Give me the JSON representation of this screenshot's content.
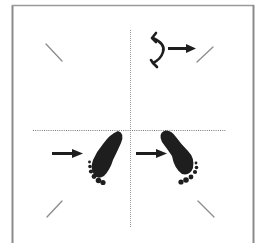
{
  "diagram": {
    "title": "",
    "colors": {
      "frame": "#8a8a8a",
      "divider": "#9a9a9a",
      "tick": "#8c8c8c",
      "ink": "#1e1e1e",
      "background": "#ffffff"
    },
    "quadrants": [
      {
        "id": "top-left",
        "content": [
          "diagonal-tick"
        ]
      },
      {
        "id": "top-right",
        "content": [
          "rotate-icon",
          "right-arrow",
          "diagonal-tick"
        ]
      },
      {
        "id": "bottom-left",
        "content": [
          "right-arrow",
          "left-footprint",
          "diagonal-tick"
        ]
      },
      {
        "id": "bottom-right",
        "content": [
          "right-arrow",
          "right-footprint",
          "diagonal-tick"
        ]
      }
    ],
    "icons": {
      "rotate": "rotate-icon",
      "arrow": "arrow-right-icon",
      "foot_left": "left-footprint-icon",
      "foot_right": "right-footprint-icon"
    }
  }
}
